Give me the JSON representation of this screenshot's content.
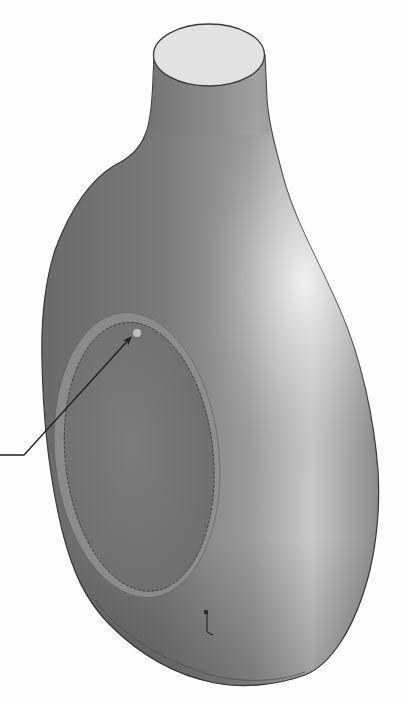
{
  "figure": {
    "subject": "3D shaded model of bottle with recessed elliptical label panel",
    "background_color": "#fdfdfd",
    "body_colors": {
      "dark": "#6e6e6e",
      "mid": "#8c8c8c",
      "highlight": "#e6e6e6",
      "top_face": "#e2e2e2",
      "outline": "#3a3a3a"
    },
    "callout": {
      "type": "leader-arrow",
      "start": [
        0,
        455
      ],
      "elbow": [
        24,
        455
      ],
      "tip": [
        132,
        336
      ],
      "color": "#1e1e1e",
      "target": "label-panel-edge"
    },
    "label_panel": {
      "shape": "ellipse",
      "center": [
        137,
        455
      ],
      "rx": 76,
      "ry": 138,
      "rotation_deg": -6
    },
    "origin_marker": {
      "position": [
        207,
        622
      ]
    }
  }
}
